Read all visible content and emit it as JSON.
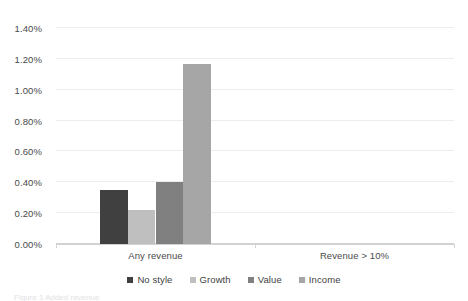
{
  "chart_data": {
    "type": "bar",
    "title": "",
    "subtitle": "",
    "xlabel": "",
    "ylabel": "",
    "categories": [
      "Any revenue",
      "Revenue > 10%"
    ],
    "series": [
      {
        "name": "No style",
        "values": [
          0.35,
          0.0
        ],
        "color": "#404040"
      },
      {
        "name": "Growth",
        "values": [
          0.22,
          0.0
        ],
        "color": "#bfbfbf"
      },
      {
        "name": "Value",
        "values": [
          0.4,
          0.0
        ],
        "color": "#808080"
      },
      {
        "name": "Income",
        "values": [
          1.17,
          0.0
        ],
        "color": "#a6a6a6"
      }
    ],
    "ylim": [
      0.0,
      1.4
    ],
    "ytick_values": [
      0.0,
      0.2,
      0.4,
      0.6,
      0.8,
      1.0,
      1.2,
      1.4
    ],
    "ytick_labels": [
      "0.00%",
      "0.20%",
      "0.40%",
      "0.60%",
      "0.80%",
      "1.00%",
      "1.20%",
      "1.40%"
    ],
    "value_format": "percent",
    "grid": {
      "horizontal": true,
      "vertical": false
    },
    "legend": {
      "position": "bottom",
      "orientation": "horizontal"
    }
  },
  "legend_entries": [
    {
      "label": "No style"
    },
    {
      "label": "Growth"
    },
    {
      "label": "Value"
    },
    {
      "label": "Income"
    }
  ],
  "caption": {
    "clipped_text": "Figure 1 Added revenue"
  }
}
